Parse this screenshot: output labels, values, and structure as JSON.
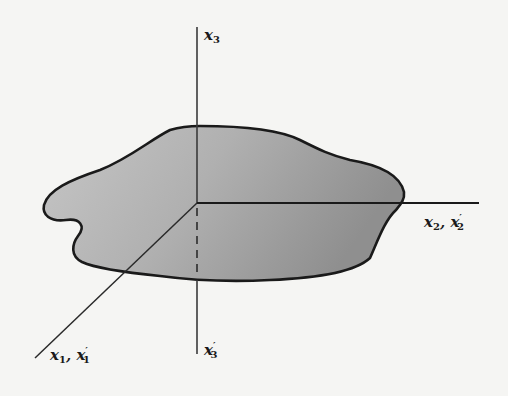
{
  "diagram": {
    "colors": {
      "background": "#f5f5f3",
      "line": "#1a1a1a",
      "region_fill_light": "#c8c8c8",
      "region_fill_dark": "#8a8a8a"
    },
    "origin": [
      197,
      203
    ],
    "axes": [
      {
        "id": "x3",
        "label_main": "x",
        "label_sub": "3",
        "label_prime": "",
        "direction": "up"
      },
      {
        "id": "x2",
        "label_main": "x",
        "label_sub": "2",
        "label_prime": "",
        "label2_main": "x",
        "label2_sub": "2",
        "label2_prime": "′",
        "direction": "right"
      },
      {
        "id": "x1",
        "label_main": "x",
        "label_sub": "1",
        "label_prime": "",
        "label2_main": "x",
        "label2_sub": "1",
        "label2_prime": "′",
        "direction": "down-left"
      },
      {
        "id": "x3prime",
        "label_main": "x",
        "label_sub": "3",
        "label_prime": "′",
        "direction": "down"
      }
    ],
    "separator": ", "
  }
}
